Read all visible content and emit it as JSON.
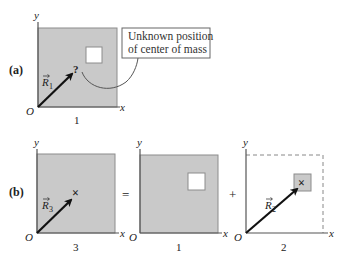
{
  "colors": {
    "plate_fill": "#c9c9c9",
    "plate_stroke": "#8c8c8c",
    "axis": "#555555",
    "arrow": "#111111",
    "hole_fill": "#ffffff",
    "dashed": "#888888",
    "callout_stroke": "#666666"
  },
  "panel_a": {
    "label": "(a)",
    "y_axis_label": "y",
    "x_axis_label": "x",
    "origin_label": "O",
    "plate_label": "1",
    "vector_label": "R",
    "vector_subscript": "1",
    "unknown_marker": "?",
    "callout": {
      "line1": "Unknown position",
      "line2": "of center of mass"
    }
  },
  "panel_b": {
    "label": "(b)",
    "equals_sign": "=",
    "plus_sign": "+",
    "left": {
      "y_axis_label": "y",
      "x_axis_label": "x",
      "origin_label": "O",
      "plate_label": "3",
      "vector_label": "R",
      "vector_subscript": "3",
      "cm_marker": "×"
    },
    "middle": {
      "y_axis_label": "y",
      "x_axis_label": "x",
      "origin_label": "O",
      "plate_label": "1"
    },
    "right": {
      "y_axis_label": "y",
      "x_axis_label": "x",
      "origin_label": "O",
      "plate_label": "2",
      "vector_label": "R",
      "vector_subscript": "2",
      "cm_marker": "×"
    }
  }
}
